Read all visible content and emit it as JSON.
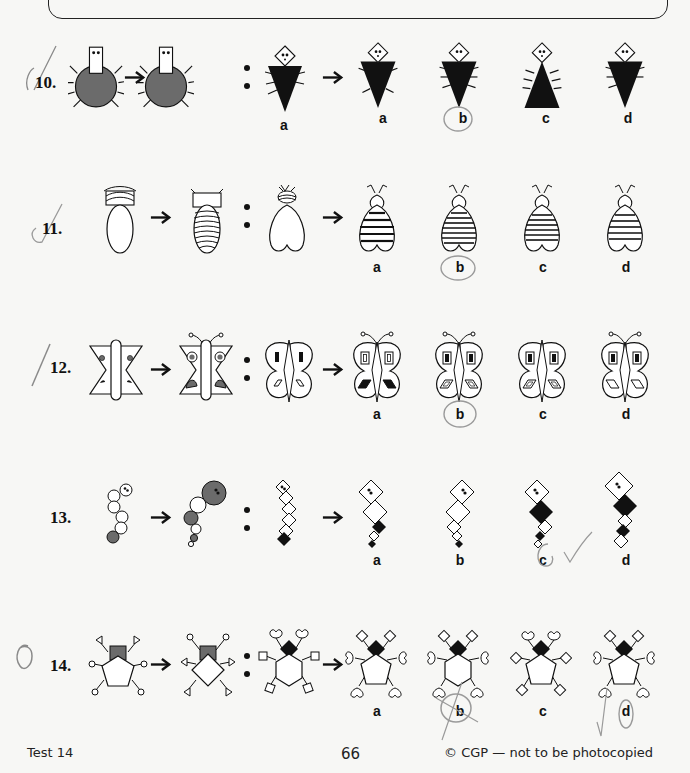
{
  "page": {
    "footer": {
      "test_label": "Test 14",
      "page_number": "66",
      "copyright": "© CGP — not to be photocopied"
    }
  },
  "questions": [
    {
      "number": "10.",
      "topic": "spider / triangle bug analogy",
      "options": [
        "a",
        "b",
        "c",
        "d"
      ],
      "marked_answer": "b",
      "mark": "tick"
    },
    {
      "number": "11.",
      "topic": "bee body stripes analogy",
      "options": [
        "a",
        "b",
        "c",
        "d"
      ],
      "marked_answer": "b",
      "mark": "tick"
    },
    {
      "number": "12.",
      "topic": "butterfly wings analogy",
      "options": [
        "a",
        "b",
        "c",
        "d"
      ],
      "marked_answer": "b",
      "mark": "tick"
    },
    {
      "number": "13.",
      "topic": "caterpillar segments analogy",
      "options": [
        "a",
        "b",
        "c",
        "d"
      ],
      "marked_answer": "c",
      "mark": "tick next to c"
    },
    {
      "number": "14.",
      "topic": "bug with limbs analogy",
      "options": [
        "a",
        "b",
        "c",
        "d"
      ],
      "marked_answer": "d",
      "crossed_out": "b",
      "mark": "zero"
    }
  ],
  "colors": {
    "ink": "#111111",
    "grey_fill": "#6b6b6b",
    "pencil": "#8a8a8a",
    "paper": "#f7f7f5"
  }
}
